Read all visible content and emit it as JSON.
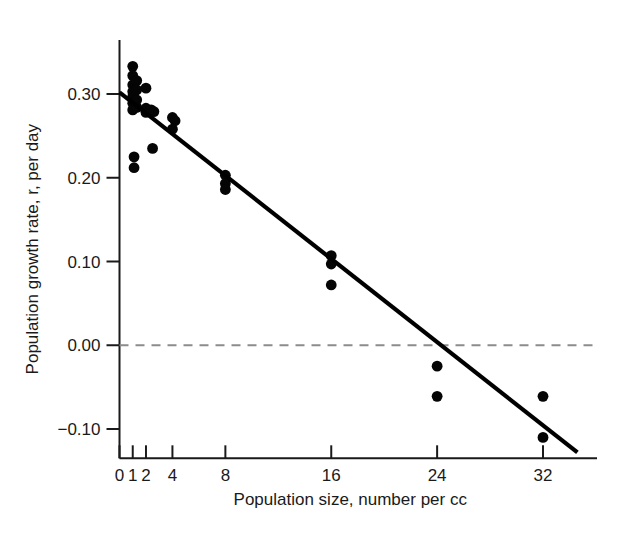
{
  "figure": {
    "background_color": "#ffffff",
    "ink_color": "#1a1a1a",
    "point_color": "#050505",
    "zeroline_color": "#8c8c8c"
  },
  "chart_data": {
    "type": "scatter",
    "title": "",
    "xlabel": "Population size, number per cc",
    "ylabel": "Population growth rate, r, per day",
    "xlim": [
      0,
      35
    ],
    "ylim": [
      -0.135,
      0.345
    ],
    "grid": false,
    "legend": null,
    "xticks": [
      0,
      1,
      2,
      4,
      8,
      16,
      24,
      32
    ],
    "xtick_labels": [
      "0",
      "1",
      "2",
      "4",
      "8",
      "16",
      "24",
      "32"
    ],
    "yticks": [
      -0.1,
      0.0,
      0.1,
      0.2,
      0.3
    ],
    "ytick_labels": [
      "−0.10",
      "0.00",
      "0.10",
      "0.20",
      "0.30"
    ],
    "points": [
      {
        "x": 1.0,
        "y": 0.333
      },
      {
        "x": 1.0,
        "y": 0.322
      },
      {
        "x": 1.0,
        "y": 0.311
      },
      {
        "x": 1.0,
        "y": 0.303
      },
      {
        "x": 1.0,
        "y": 0.297
      },
      {
        "x": 1.0,
        "y": 0.289
      },
      {
        "x": 1.0,
        "y": 0.281
      },
      {
        "x": 1.3,
        "y": 0.316
      },
      {
        "x": 1.3,
        "y": 0.305
      },
      {
        "x": 1.3,
        "y": 0.293
      },
      {
        "x": 1.3,
        "y": 0.284
      },
      {
        "x": 2.0,
        "y": 0.307
      },
      {
        "x": 2.0,
        "y": 0.283
      },
      {
        "x": 2.0,
        "y": 0.278
      },
      {
        "x": 2.4,
        "y": 0.281
      },
      {
        "x": 2.6,
        "y": 0.279
      },
      {
        "x": 1.1,
        "y": 0.225
      },
      {
        "x": 1.1,
        "y": 0.212
      },
      {
        "x": 2.5,
        "y": 0.235
      },
      {
        "x": 4.0,
        "y": 0.272
      },
      {
        "x": 4.2,
        "y": 0.268
      },
      {
        "x": 4.0,
        "y": 0.258
      },
      {
        "x": 8.0,
        "y": 0.203
      },
      {
        "x": 8.0,
        "y": 0.193
      },
      {
        "x": 8.0,
        "y": 0.186
      },
      {
        "x": 16.0,
        "y": 0.107
      },
      {
        "x": 16.0,
        "y": 0.097
      },
      {
        "x": 16.0,
        "y": 0.072
      },
      {
        "x": 24.0,
        "y": -0.025
      },
      {
        "x": 24.0,
        "y": -0.061
      },
      {
        "x": 32.0,
        "y": -0.061
      },
      {
        "x": 32.0,
        "y": -0.11
      }
    ],
    "fit_line": {
      "label": "linear regression fit",
      "x_start": 0.0,
      "y_start": 0.302,
      "x_end": 34.6,
      "y_end": -0.128
    },
    "reference_line": {
      "label": "zero growth rate",
      "y": 0.0,
      "style": "dashed"
    }
  }
}
